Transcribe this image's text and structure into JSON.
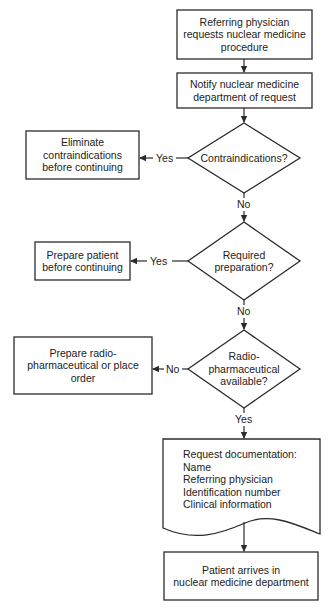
{
  "diagram": {
    "type": "flowchart",
    "nodes": {
      "start": {
        "shape": "rectangle",
        "lines": [
          "Referring physician",
          "requests nuclear medicine",
          "procedure"
        ]
      },
      "notify": {
        "shape": "rectangle",
        "lines": [
          "Notify nuclear medicine",
          "department of request"
        ]
      },
      "contra_decision": {
        "shape": "diamond",
        "lines": [
          "Contraindications?"
        ]
      },
      "eliminate": {
        "shape": "rectangle",
        "lines": [
          "Eliminate",
          "contraindications",
          "before continuing"
        ]
      },
      "prep_decision": {
        "shape": "diamond",
        "lines": [
          "Required",
          "preparation?"
        ]
      },
      "prepare_patient": {
        "shape": "rectangle",
        "lines": [
          "Prepare patient",
          "before continuing"
        ]
      },
      "radio_decision": {
        "shape": "diamond",
        "lines": [
          "Radio-",
          "pharmaceutical",
          "available?"
        ]
      },
      "prepare_radio": {
        "shape": "rectangle",
        "lines": [
          "Prepare radio-",
          "pharmaceutical or place",
          "order"
        ]
      },
      "documentation": {
        "shape": "document",
        "lines": [
          "Request documentation:",
          "Name",
          "Referring physician",
          "Identification number",
          "Clinical information"
        ]
      },
      "arrives": {
        "shape": "rectangle",
        "lines": [
          "Patient arrives in",
          "nuclear medicine department"
        ]
      }
    },
    "edges": [
      {
        "from": "start",
        "to": "notify",
        "label": ""
      },
      {
        "from": "notify",
        "to": "contra_decision",
        "label": ""
      },
      {
        "from": "contra_decision",
        "to": "eliminate",
        "label": "Yes"
      },
      {
        "from": "contra_decision",
        "to": "prep_decision",
        "label": "No"
      },
      {
        "from": "prep_decision",
        "to": "prepare_patient",
        "label": "Yes"
      },
      {
        "from": "prep_decision",
        "to": "radio_decision",
        "label": "No"
      },
      {
        "from": "radio_decision",
        "to": "prepare_radio",
        "label": "No"
      },
      {
        "from": "radio_decision",
        "to": "documentation",
        "label": "Yes"
      },
      {
        "from": "documentation",
        "to": "arrives",
        "label": ""
      }
    ],
    "labels": {
      "contra_yes": "Yes",
      "contra_no": "No",
      "prep_yes": "Yes",
      "prep_no": "No",
      "radio_no": "No",
      "radio_yes": "Yes"
    },
    "colors": {
      "stroke": "#2b2b2b",
      "text": "#222222",
      "background": "#ffffff"
    }
  }
}
